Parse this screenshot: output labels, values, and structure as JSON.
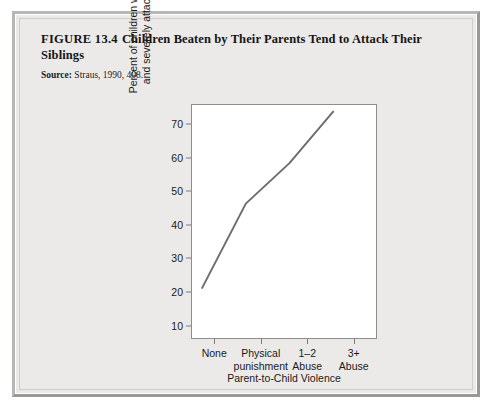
{
  "figure": {
    "number": "FIGURE 13.4",
    "title": "Children Beaten by Their Parents Tend to Attack Their Siblings",
    "source_label": "Source:",
    "source_text": "Straus, 1990, 408."
  },
  "colors": {
    "line": "#6e6e6e",
    "axis": "#8f8d8b",
    "plot_background": "#ffffff",
    "figure_background": "#eceae8",
    "text": "#1a1a1a"
  },
  "chart_data": {
    "type": "line",
    "title": "Children Beaten by Their Parents Tend to Attack Their Siblings",
    "xlabel": "Parent-to-Child Violence",
    "ylabel": "Percent of children who repeatedly and severely attacked a sibling",
    "ylabel_line1": "Percent of children who repeatedly",
    "ylabel_line2": "and severely attacked a sibling",
    "categories": [
      "None",
      "Physical punishment",
      "1–2 Abuse",
      "3+ Abuse"
    ],
    "category_lines": [
      [
        "None"
      ],
      [
        "Physical",
        "punishment"
      ],
      [
        "1–2",
        "Abuse"
      ],
      [
        "3+",
        "Abuse"
      ]
    ],
    "values": [
      15,
      42,
      55,
      71.5
    ],
    "yticks": [
      10,
      20,
      30,
      40,
      50,
      60,
      70
    ],
    "ylim": [
      6,
      76
    ],
    "grid": false,
    "legend": false,
    "series": [
      {
        "name": "Percent who attacked a sibling",
        "values": [
          15,
          42,
          55,
          71.5
        ]
      }
    ]
  }
}
